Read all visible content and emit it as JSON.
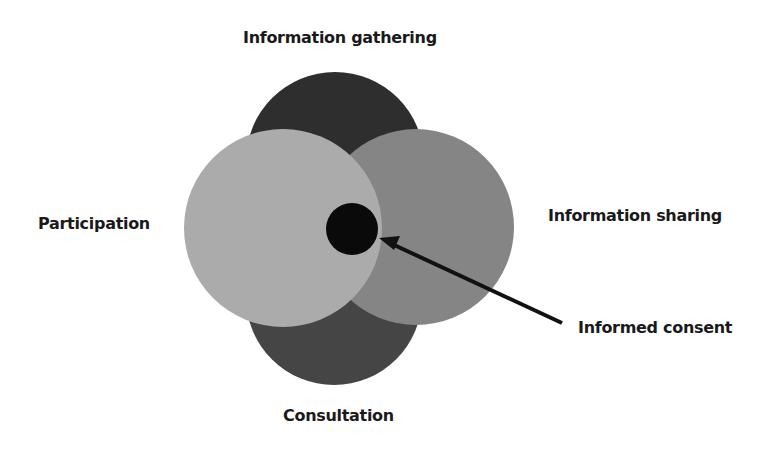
{
  "diagram": {
    "labels": {
      "top": "Information gathering",
      "left": "Participation",
      "right": "Information sharing",
      "bottom": "Consultation",
      "callout": "Informed consent"
    },
    "circles": [
      {
        "name": "information-gathering",
        "cx": 335,
        "cy": 161,
        "r": 89,
        "color": "#2e2e2e"
      },
      {
        "name": "consultation",
        "cx": 334,
        "cy": 297,
        "r": 88,
        "color": "#454545"
      },
      {
        "name": "information-sharing",
        "cx": 416,
        "cy": 227,
        "r": 98,
        "color": "#858585"
      },
      {
        "name": "participation",
        "cx": 283,
        "cy": 228,
        "r": 99,
        "color": "#ababab"
      },
      {
        "name": "informed-consent",
        "cx": 352,
        "cy": 229,
        "r": 26,
        "color": "#0a0a0a"
      }
    ],
    "arrow": {
      "x1": 562,
      "y1": 323,
      "x2": 379,
      "y2": 238,
      "color": "#111111"
    }
  }
}
